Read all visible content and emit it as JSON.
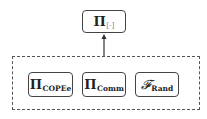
{
  "diagram": {
    "top_node": {
      "symbol": "Π",
      "subscript": "[·]"
    },
    "group": {
      "style": "dashed",
      "nodes": [
        {
          "symbol": "Π",
          "subscript": "COPEe"
        },
        {
          "symbol": "Π",
          "subscript": "Comm"
        },
        {
          "symbol": "𝓕",
          "subscript": "Rand"
        }
      ]
    },
    "edges": [
      {
        "from": "group",
        "to": "top_node",
        "type": "arrow"
      }
    ]
  }
}
